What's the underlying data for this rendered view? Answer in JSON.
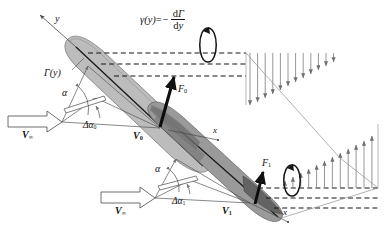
{
  "figure": {
    "labels": {
      "y_axis": "y",
      "x_axis_upper": "x",
      "x_axis_lower": "x",
      "gamma_lead": "γ(y)",
      "gamma_equals": "=",
      "gamma_minus": "−",
      "gamma_num_d": "d",
      "gamma_num_gamma": "Γ",
      "gamma_den_d": "d",
      "gamma_den_y": "y",
      "circulation": "Γ(y)",
      "force_0": "F",
      "force_0_sub": "0",
      "force_1": "F",
      "force_1_sub": "1",
      "alpha_upper": "α",
      "alpha_lower": "α",
      "delta_alpha_0": "Δα",
      "delta_alpha_0_sub": "0",
      "delta_alpha_1": "Δα",
      "delta_alpha_1_sub": "1",
      "v_inf_upper": "V",
      "v_inf_upper_sub": "∞",
      "v_inf_lower": "V",
      "v_inf_lower_sub": "∞",
      "v_0": "V",
      "v_0_sub": "0",
      "v_1": "V",
      "v_1_sub": "1"
    },
    "colors": {
      "ink": "#141414",
      "line": "#4a4a4a",
      "wing_light": "#b9b9b9",
      "wing_mid": "#a3a3a3",
      "wing_dark": "#6e6e6e",
      "arrow_gray": "#8a8a8a",
      "background": "#ffffff"
    },
    "downwash_upper": {
      "direction": "down",
      "count": 12,
      "lengths": [
        52,
        49,
        45,
        41,
        37,
        33,
        29,
        25,
        21,
        17,
        13,
        9
      ]
    },
    "downwash_lower": {
      "direction": "up",
      "count": 12,
      "lengths": [
        7,
        11,
        15,
        19,
        23,
        27,
        31,
        35,
        39,
        43,
        47,
        52
      ]
    },
    "vortex_rings": [
      {
        "name": "upper-vortex-ring",
        "cx": 208,
        "cy": 45,
        "rx": 11,
        "ry": 17
      },
      {
        "name": "lower-vortex-ring",
        "cx": 292,
        "cy": 180,
        "rx": 11,
        "ry": 15
      }
    ]
  }
}
